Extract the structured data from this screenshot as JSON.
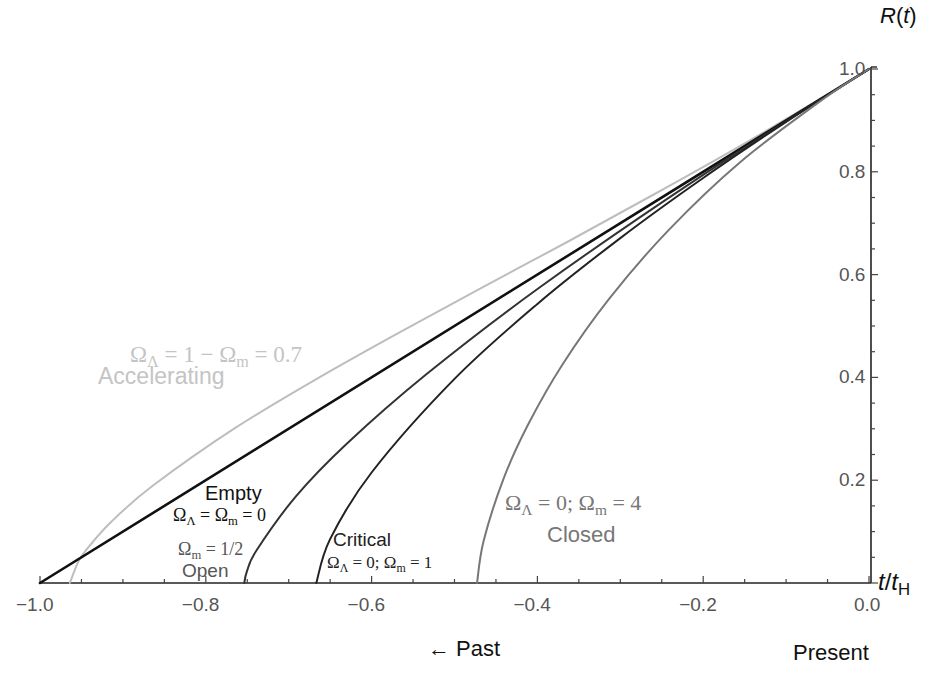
{
  "chart_data": {
    "type": "line",
    "title": "",
    "xlabel": "t/t_H",
    "ylabel": "R(t)",
    "xlim": [
      -1.0,
      0.0
    ],
    "ylim": [
      0.0,
      1.0
    ],
    "grid": false,
    "x_ticks": [
      "-1.0",
      "-0.8",
      "-0.6",
      "-0.4",
      "-0.2",
      "0.0"
    ],
    "y_ticks": [
      "0.2",
      "0.4",
      "0.6",
      "0.8",
      "1.0"
    ],
    "annotations": {
      "past": "← Past",
      "present": "Present"
    },
    "series": [
      {
        "name": "Accelerating",
        "params": "ΩΛ = 1 − Ωm = 0.7",
        "color": "#bdbdbd",
        "width": 2,
        "points": [
          [
            -0.964,
            0
          ],
          [
            -0.954,
            0.0407
          ],
          [
            -0.944,
            0.0647
          ],
          [
            -0.914,
            0.1191
          ],
          [
            -0.864,
            0.1892
          ],
          [
            -0.764,
            0.3022
          ],
          [
            -0.664,
            0.3993
          ],
          [
            -0.564,
            0.4897
          ],
          [
            -0.464,
            0.5772
          ],
          [
            -0.364,
            0.6635
          ],
          [
            -0.264,
            0.7519
          ],
          [
            -0.164,
            0.8423
          ],
          [
            -0.064,
            0.9369
          ],
          [
            0,
            1
          ]
        ]
      },
      {
        "name": "Empty",
        "params": "ΩΛ = Ωm = 0",
        "color": "#111111",
        "width": 2.6,
        "points": [
          [
            -1,
            0
          ],
          [
            0,
            1
          ]
        ]
      },
      {
        "name": "Open",
        "params": "Ωm = 1/2",
        "color": "#333333",
        "width": 2,
        "points": [
          [
            -0.7536,
            0
          ],
          [
            -0.7504,
            0.0227
          ],
          [
            -0.7387,
            0.0638
          ],
          [
            -0.6913,
            0.1687
          ],
          [
            -0.6297,
            0.2715
          ],
          [
            -0.5347,
            0.4052
          ],
          [
            -0.397,
            0.5754
          ],
          [
            -0.2051,
            0.7887
          ],
          [
            0,
            1
          ]
        ]
      },
      {
        "name": "Critical",
        "params": "ΩΛ = 0; Ωm = 1",
        "color": "#222222",
        "width": 2,
        "points": [
          [
            -0.6667,
            0
          ],
          [
            -0.65,
            0.0855
          ],
          [
            -0.6,
            0.215
          ],
          [
            -0.5,
            0.397
          ],
          [
            -0.4,
            0.543
          ],
          [
            -0.3,
            0.671
          ],
          [
            -0.2,
            0.788
          ],
          [
            -0.1,
            0.897
          ],
          [
            0,
            1
          ]
        ]
      },
      {
        "name": "Closed",
        "params": "ΩΛ = 0; Ωm = 4",
        "color": "#777777",
        "width": 2,
        "points": [
          [
            -0.4728,
            0
          ],
          [
            -0.4649,
            0.0817
          ],
          [
            -0.441,
            0.2022
          ],
          [
            -0.4118,
            0.3065
          ],
          [
            -0.3697,
            0.4251
          ],
          [
            -0.3133,
            0.5534
          ],
          [
            -0.2417,
            0.6866
          ],
          [
            -0.1548,
            0.8196
          ],
          [
            -0.053,
            0.9441
          ],
          [
            0,
            1
          ]
        ]
      }
    ]
  },
  "labels": {
    "accelerating_params": "ΩΛ = 1 − Ωm = 0.7",
    "accelerating_name": "Accelerating",
    "empty_name": "Empty",
    "empty_params": "ΩΛ = Ωm = 0",
    "open_params": "Ωm = 1/2",
    "open_name": "Open",
    "critical_name": "Critical",
    "critical_params": "ΩΛ = 0; Ωm = 1",
    "closed_params": "ΩΛ = 0; Ωm = 4",
    "closed_name": "Closed",
    "y_axis_title": "R(t)",
    "x_axis_title": "t/tH",
    "past": "← Past",
    "present": "Present"
  }
}
